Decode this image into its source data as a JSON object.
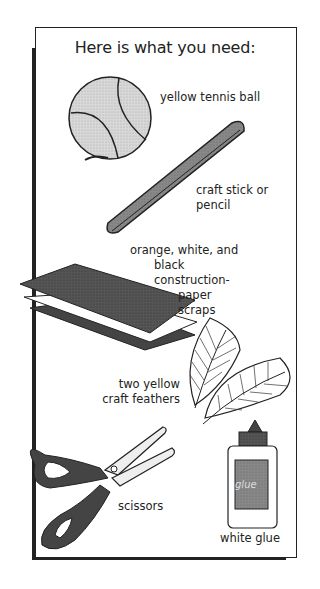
{
  "title": "Here is what you need:",
  "items": [
    {
      "label": "yellow tennis ball",
      "icon": "tennis-ball"
    },
    {
      "label_lines": [
        "craft stick or",
        "pencil"
      ],
      "icon": "craft-stick"
    },
    {
      "label_lines": [
        "orange, white, and",
        "black construction-",
        "paper scraps"
      ],
      "icon": "paper-scraps"
    },
    {
      "label_lines": [
        "two yellow",
        "craft feathers"
      ],
      "icon": "feathers"
    },
    {
      "label": "scissors",
      "icon": "scissors"
    },
    {
      "label": "white glue",
      "icon": "glue-bottle",
      "bottle_text": "glue"
    }
  ]
}
